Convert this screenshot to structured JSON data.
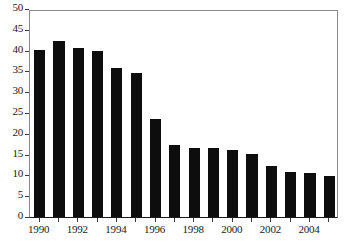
{
  "chart_data": {
    "type": "bar",
    "title": "",
    "subtitle": "",
    "xlabel": "",
    "ylabel": "",
    "categories": [
      "1990",
      "1991",
      "1992",
      "1993",
      "1994",
      "1995",
      "1996",
      "1997",
      "1998",
      "1999",
      "2000",
      "2001",
      "2002",
      "2003",
      "2004",
      "2005"
    ],
    "values": [
      40.1,
      42.3,
      40.6,
      39.8,
      35.8,
      34.7,
      23.6,
      17.4,
      16.6,
      16.5,
      16.2,
      15.2,
      12.2,
      10.8,
      10.6,
      9.9
    ],
    "series": [
      {
        "name": "",
        "values": [
          40.1,
          42.3,
          40.6,
          39.8,
          35.8,
          34.7,
          23.6,
          17.4,
          16.6,
          16.5,
          16.2,
          15.2,
          12.2,
          10.8,
          10.6,
          9.9
        ]
      }
    ],
    "ylim": [
      0,
      50
    ],
    "ytick_values": [
      0,
      5,
      10,
      15,
      20,
      25,
      30,
      35,
      40,
      45,
      50
    ],
    "ytick_labels": [
      "0",
      "5",
      "10",
      "15",
      "20",
      "25",
      "30",
      "35",
      "40",
      "45",
      "50"
    ],
    "xtick_labels": [
      "1990",
      "",
      "1992",
      "",
      "1994",
      "",
      "1996",
      "",
      "1998",
      "",
      "2000",
      "",
      "2002",
      "",
      "2004",
      ""
    ],
    "grid": false,
    "legend": null,
    "legend_position": "none",
    "bar_color": "#0d0d0d",
    "frame_color": "#8a8a8a",
    "axis_color": "#1a1a1a",
    "background": "#ffffff",
    "annotations": []
  },
  "caption": {
    "text": ""
  }
}
